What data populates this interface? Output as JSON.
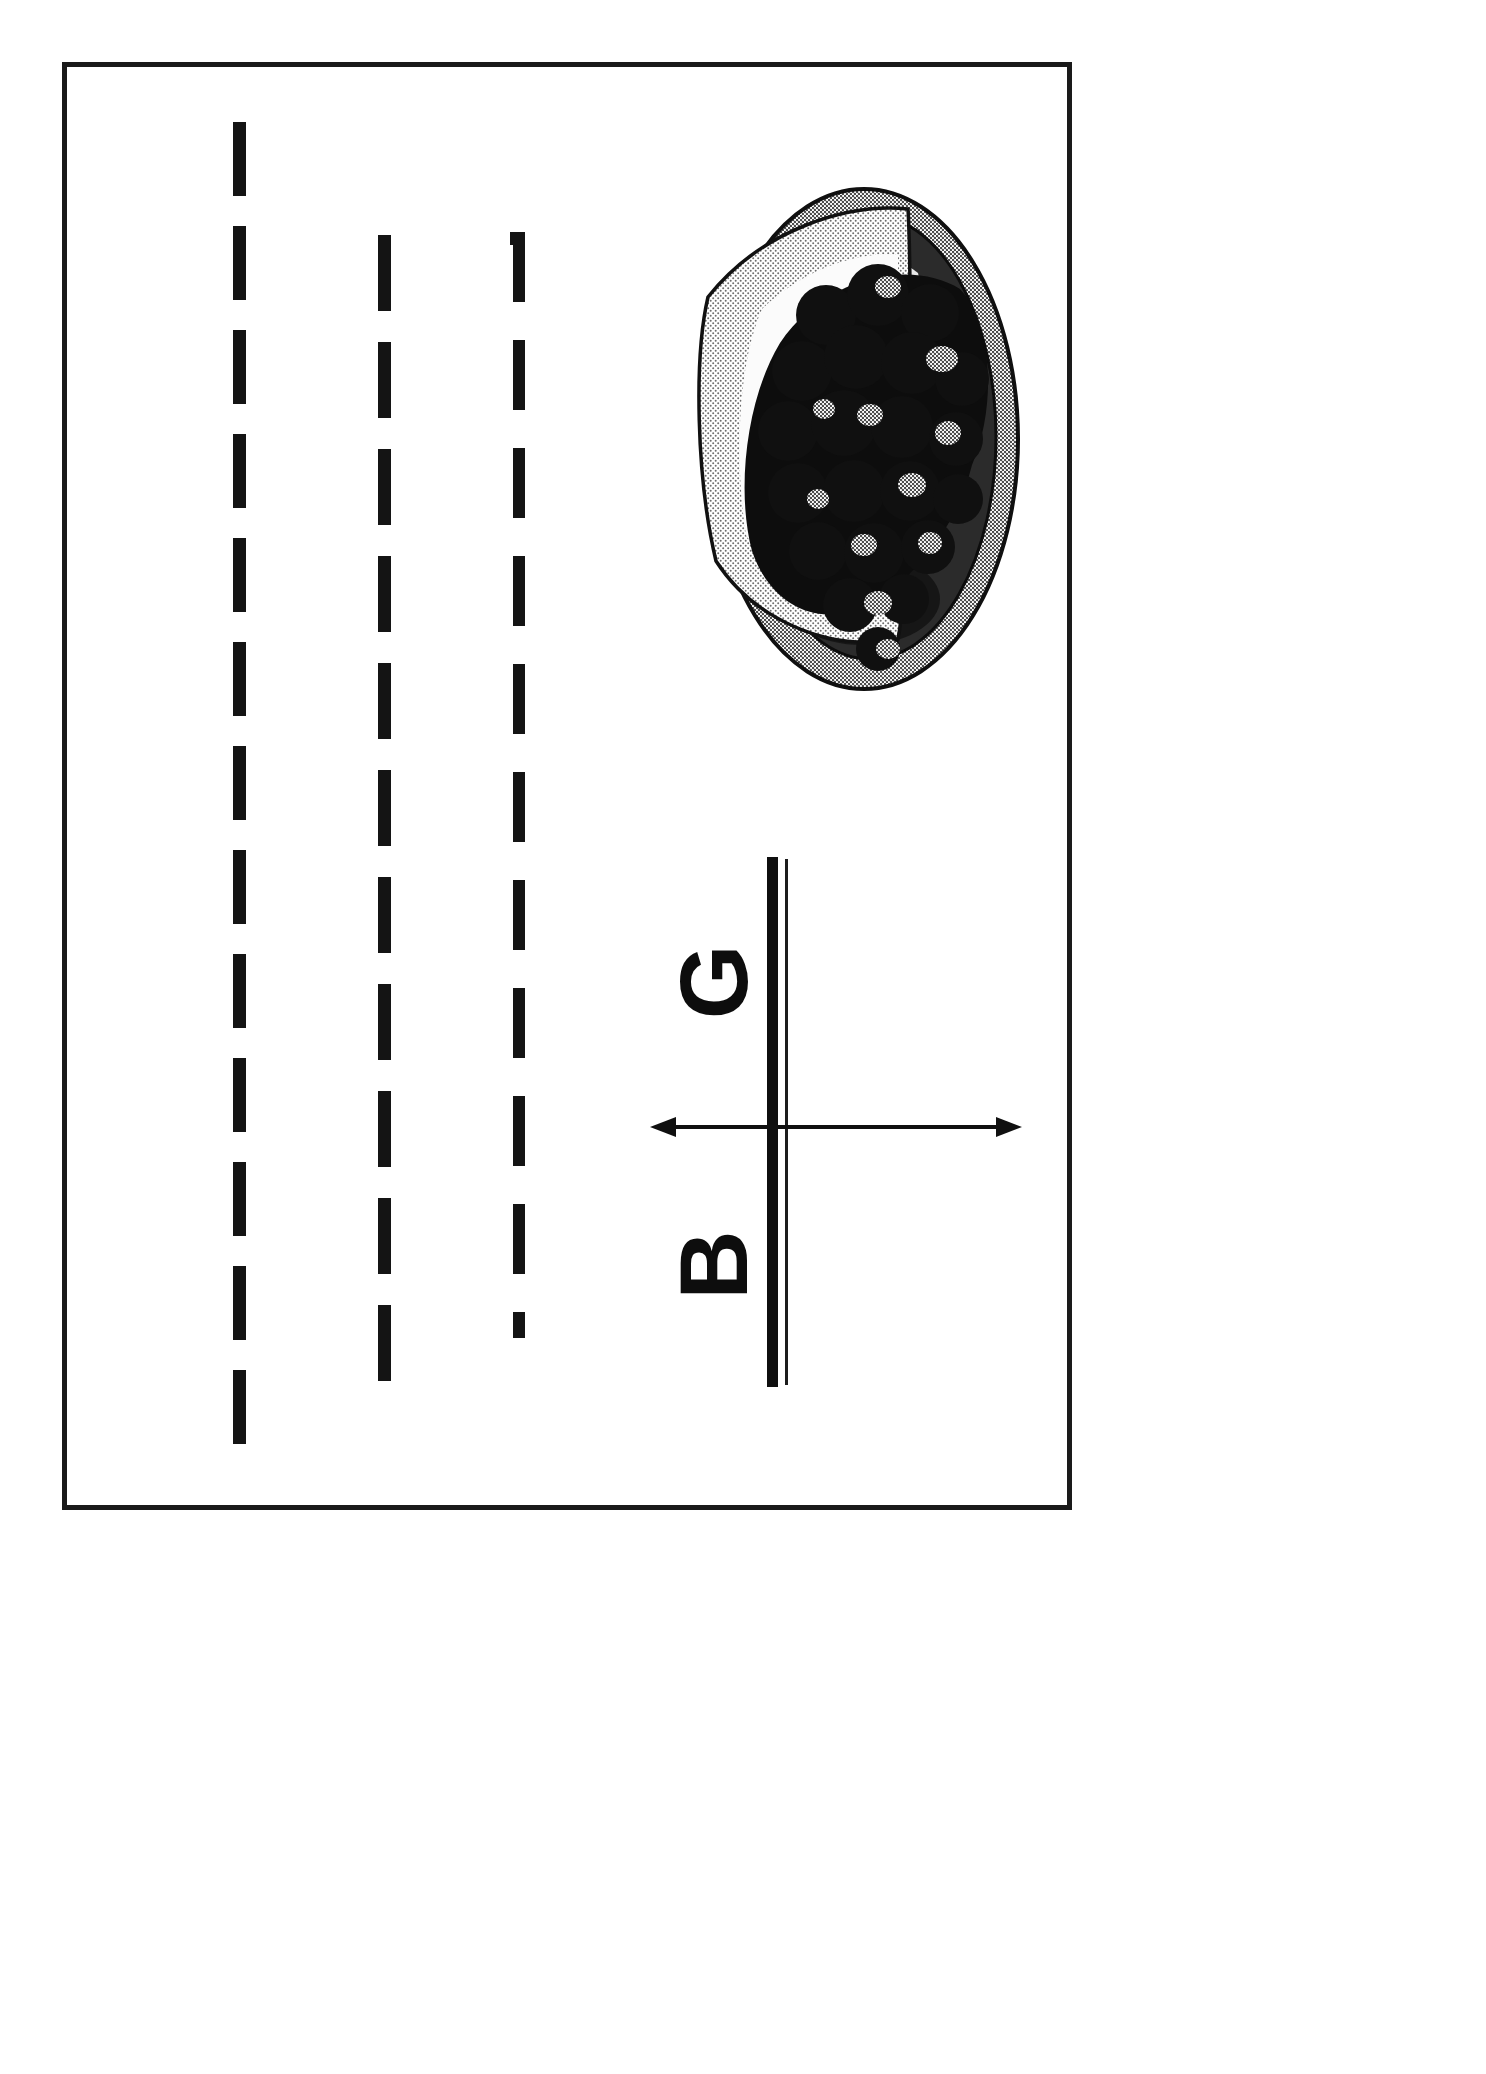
{
  "page": {
    "orientation": "rotated-90-ccw",
    "background_color": "#ffffff",
    "frame_color": "#1a1a1a",
    "ink_color": "#0f0f0f"
  },
  "frame": {
    "name": "page-border",
    "style": "solid rectangle outline"
  },
  "guides": [
    {
      "name": "guide-line-1",
      "style": "dashed",
      "orientation": "vertical"
    },
    {
      "name": "guide-line-2",
      "style": "dashed",
      "orientation": "vertical"
    },
    {
      "name": "guide-line-3",
      "style": "dashed",
      "orientation": "vertical"
    }
  ],
  "axis": {
    "name": "labeled-axis",
    "vertical_rule": "thick line with thin parallel companion line",
    "arrow": {
      "name": "double-headed-arrow",
      "direction": "horizontal",
      "heads": 2
    },
    "labels": [
      {
        "name": "axis-label-g",
        "text": "G",
        "position": "upper",
        "rotation": "-90deg"
      },
      {
        "name": "axis-label-b",
        "text": "B",
        "position": "lower",
        "rotation": "-90deg"
      }
    ]
  },
  "illustration": {
    "name": "grapes-on-plate-illustration",
    "subject": "bunch of dark grapes on an oval plate",
    "colors": {
      "grape_dark": "#141414",
      "grape_highlight": "#b8b8b8",
      "plate_rim": "#8a8a8a",
      "plate_shadow": "#3a3a3a",
      "plate_light": "#efefef",
      "outline": "#111111"
    }
  },
  "icons": {
    "arrow_left_head": "arrow-left-head-icon",
    "arrow_right_head": "arrow-right-head-icon"
  }
}
